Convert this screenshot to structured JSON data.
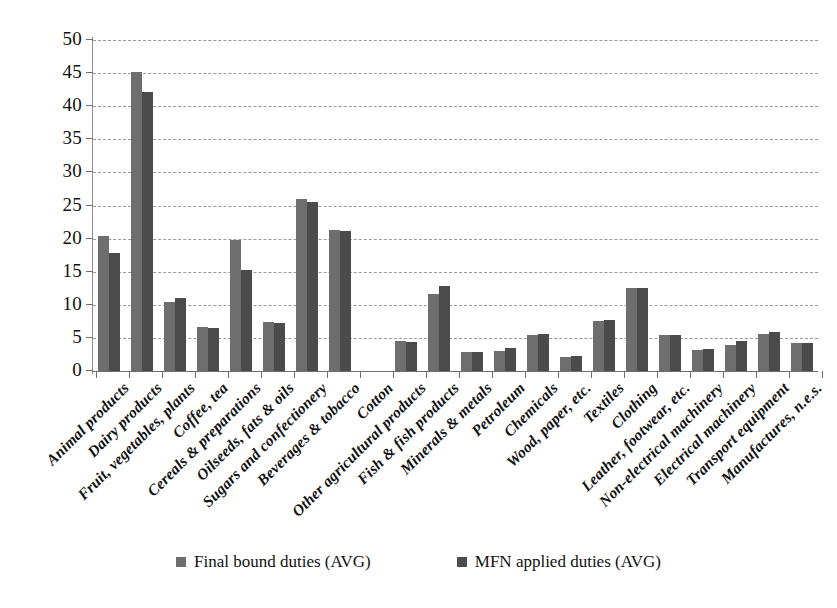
{
  "chart_data": {
    "type": "bar",
    "title": "",
    "subtitle": "",
    "xlabel": "",
    "ylabel": "",
    "ylim": [
      0,
      50
    ],
    "ytick_step": 5,
    "yticks": [
      0,
      5,
      10,
      15,
      20,
      25,
      30,
      35,
      40,
      45,
      50
    ],
    "ytick_labels": [
      "0",
      "5",
      "10",
      "15",
      "20",
      "25",
      "30",
      "35",
      "40",
      "45",
      "50"
    ],
    "grid": "horizontal-dashed",
    "legend_position": "bottom",
    "categories": [
      "Animal products",
      "Dairy products",
      "Fruit, vegetables, plants",
      "Coffee, tea",
      "Cereals & preparations",
      "Oilseeds, fats & oils",
      "Sugars and confectionery",
      "Beverages & tobacco",
      "Cotton",
      "Other agricultural products",
      "Fish & fish products",
      "Minerals & metals",
      "Petroleum",
      "Chemicals",
      "Wood, paper, etc.",
      "Textiles",
      "Clothing",
      "Leather, footwear, etc.",
      "Non-electrical machinery",
      "Electrical machinery",
      "Transport equipment",
      "Manufactures, n.e.s."
    ],
    "series": [
      {
        "name": "Final bound duties (AVG)",
        "color": "#6e6e6e",
        "values": [
          20.4,
          45.1,
          10.5,
          6.6,
          19.8,
          7.4,
          26.0,
          21.3,
          null,
          4.5,
          11.6,
          2.9,
          3.0,
          5.5,
          2.1,
          7.6,
          12.5,
          5.5,
          3.2,
          4.0,
          5.6,
          4.2
        ]
      },
      {
        "name": "MFN applied duties (AVG)",
        "color": "#4b4b4b",
        "values": [
          17.8,
          42.1,
          11.0,
          6.5,
          15.2,
          7.3,
          25.5,
          21.1,
          null,
          4.4,
          12.8,
          2.9,
          3.5,
          5.6,
          2.2,
          7.7,
          12.6,
          5.4,
          3.4,
          4.5,
          5.9,
          4.3
        ]
      }
    ]
  },
  "legend": {
    "items": [
      {
        "label": "Final bound duties (AVG)",
        "swatch": "series-0-swatch"
      },
      {
        "label": "MFN applied duties (AVG)",
        "swatch": "series-1-swatch"
      }
    ]
  }
}
